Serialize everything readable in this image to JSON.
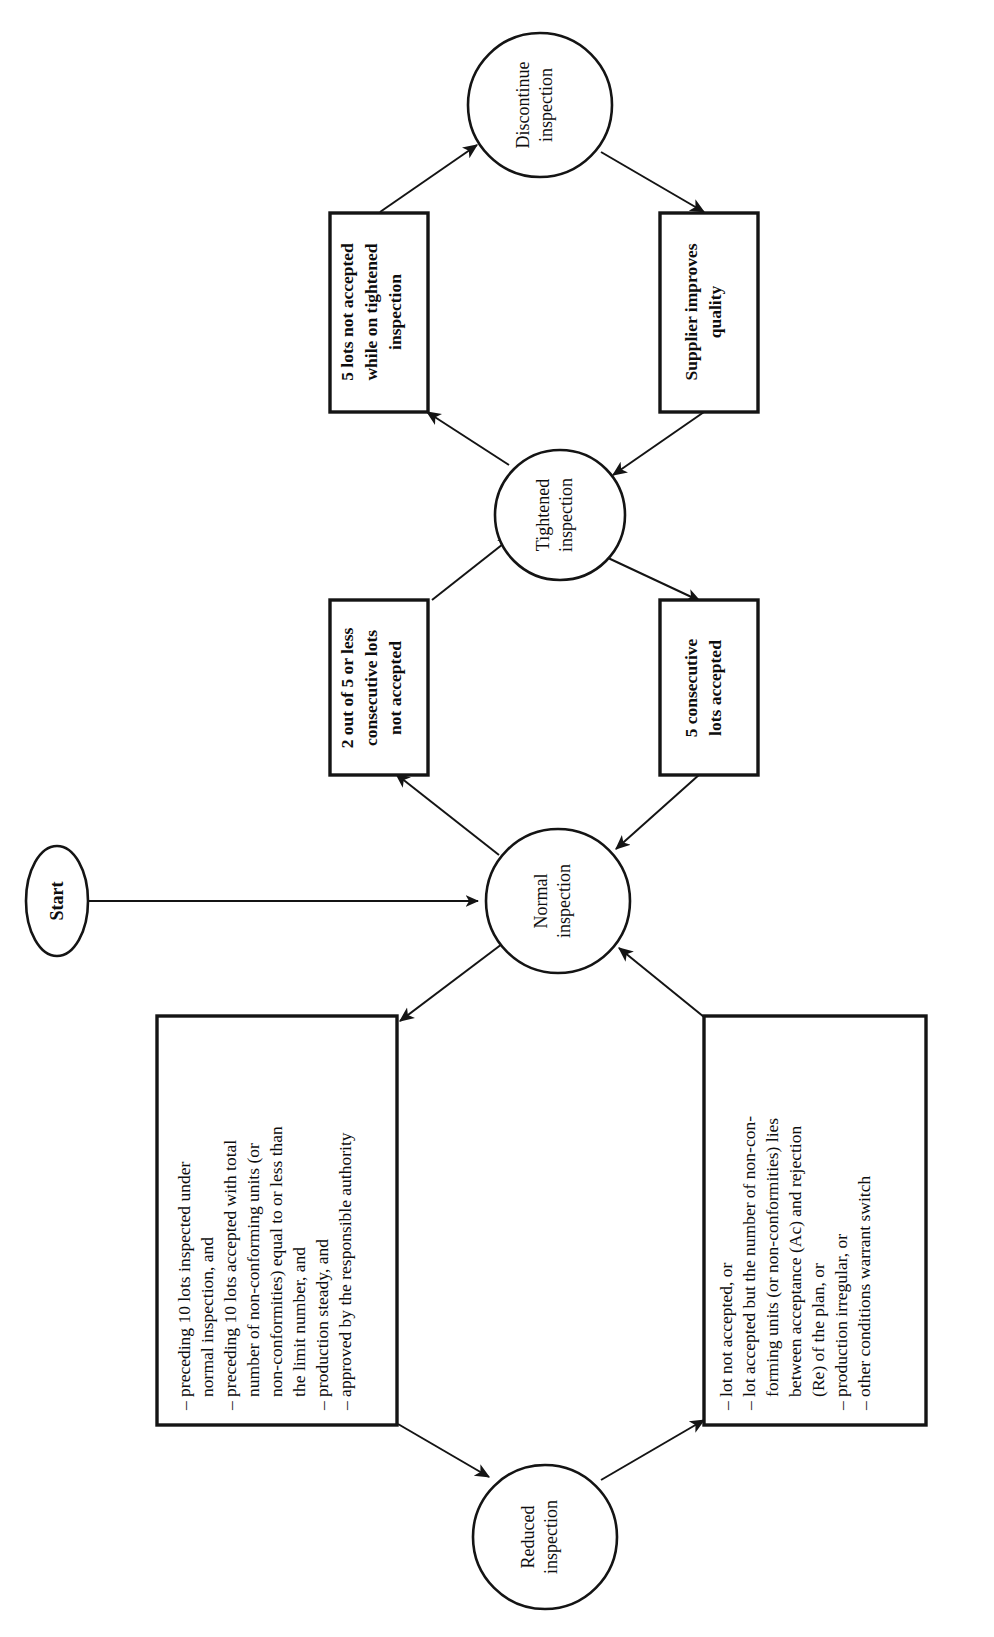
{
  "diagram": {
    "orientation": "rotated-90-ccw",
    "background_color": "#ffffff",
    "line_color": "#141414",
    "nodes": {
      "start": {
        "shape": "ellipse",
        "label": "Start"
      },
      "normal": {
        "shape": "circle",
        "line1": "Normal",
        "line2": "inspection"
      },
      "tightened": {
        "shape": "circle",
        "line1": "Tightened",
        "line2": "inspection"
      },
      "reduced": {
        "shape": "circle",
        "line1": "Reduced",
        "line2": "inspection"
      },
      "discontinue": {
        "shape": "circle",
        "line1": "Discontinue",
        "line2": "inspection"
      },
      "cond_two_of_five": {
        "shape": "rect",
        "line1": "2 out of 5 or less",
        "line2": "consecutive lots",
        "line3": "not accepted"
      },
      "cond_five_consecutive_accepted": {
        "shape": "rect",
        "line1": "5 consecutive",
        "line2": "lots accepted"
      },
      "cond_five_not_accepted": {
        "shape": "rect",
        "line1": "5 lots not accepted",
        "line2": "while on tightened",
        "line3": "inspection"
      },
      "cond_supplier_improves": {
        "shape": "rect",
        "line1": "Supplier improves",
        "line2": "quality"
      },
      "cond_to_reduced": {
        "shape": "rect",
        "lines": [
          "– preceding 10 lots inspected under",
          "   normal inspection, and",
          "– preceding 10 lots accepted with total",
          "   number of non-conforming units (or",
          "   non-conformities) equal to or less than",
          "   the limit number, and",
          "– production steady, and",
          "– approved by the responsible authority"
        ]
      },
      "cond_from_reduced": {
        "shape": "rect",
        "lines": [
          "– lot not accepted, or",
          "– lot accepted but the number of non-con-",
          "   forming units (or non-conformities) lies",
          "   between acceptance (Ac) and rejection",
          "   (Re) of the plan, or",
          "– production irregular, or",
          "– other conditions warrant switch"
        ]
      }
    },
    "edges": [
      {
        "id": "start-to-normal",
        "from": "start",
        "to": "normal",
        "arrow": true
      },
      {
        "id": "normal-to-cond-two-of-five",
        "from": "normal",
        "to": "cond_two_of_five",
        "arrow": true
      },
      {
        "id": "cond-two-of-five-to-tightened",
        "from": "cond_two_of_five",
        "to": "tightened",
        "arrow": true
      },
      {
        "id": "tightened-to-cond-five-consecutive-accepted",
        "from": "tightened",
        "to": "cond_five_consecutive_accepted",
        "arrow": true
      },
      {
        "id": "cond-five-consecutive-accepted-to-normal",
        "from": "cond_five_consecutive_accepted",
        "to": "normal",
        "arrow": true
      },
      {
        "id": "tightened-to-cond-five-not-accepted",
        "from": "tightened",
        "to": "cond_five_not_accepted",
        "arrow": true
      },
      {
        "id": "cond-five-not-accepted-to-discontinue",
        "from": "cond_five_not_accepted",
        "to": "discontinue",
        "arrow": true
      },
      {
        "id": "discontinue-to-cond-supplier-improves",
        "from": "discontinue",
        "to": "cond_supplier_improves",
        "arrow": true
      },
      {
        "id": "cond-supplier-improves-to-tightened",
        "from": "cond_supplier_improves",
        "to": "tightened",
        "arrow": true
      },
      {
        "id": "normal-to-cond-to-reduced",
        "from": "normal",
        "to": "cond_to_reduced",
        "arrow": true
      },
      {
        "id": "cond-to-reduced-to-reduced",
        "from": "cond_to_reduced",
        "to": "reduced",
        "arrow": true
      },
      {
        "id": "reduced-to-cond-from-reduced",
        "from": "reduced",
        "to": "cond_from_reduced",
        "arrow": true
      },
      {
        "id": "cond-from-reduced-to-normal",
        "from": "cond_from_reduced",
        "to": "normal",
        "arrow": true
      }
    ]
  }
}
